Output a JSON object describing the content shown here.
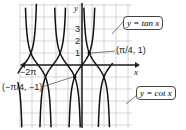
{
  "chart_data": {
    "type": "line",
    "title": "",
    "xlabel": "x",
    "ylabel": "y",
    "series": [
      {
        "name": "y = tan x",
        "function": "tan(x)"
      },
      {
        "name": "y = cot x",
        "function": "cot(x)"
      }
    ],
    "x_tick_labels": [
      "-2π"
    ],
    "y_tick_labels": [
      "1",
      "2",
      "3"
    ],
    "annotations": [
      {
        "label": "(π/4, 1)",
        "x": 0.785,
        "y": 1
      },
      {
        "label": "(−π/4, −1)",
        "x": -0.785,
        "y": -1
      }
    ],
    "xlim": [
      -6.9,
      3.3
    ],
    "ylim": [
      -4.2,
      4.2
    ],
    "grid": true
  },
  "labels": {
    "y_axis": "y",
    "x_axis": "x",
    "neg_two_pi": "−2π",
    "tick_1": "1",
    "tick_2": "2",
    "tick_3": "3",
    "point_pos": "(π/4, 1)",
    "point_neg": "(−π/4, −1)",
    "tan_label": "y = tan x",
    "cot_label": "y = cot x"
  }
}
